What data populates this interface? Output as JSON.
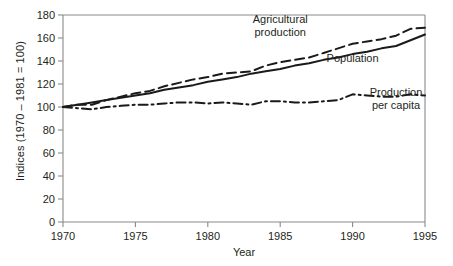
{
  "chart_data": {
    "type": "line",
    "title": "",
    "xlabel": "Year",
    "ylabel": "Indices (1970 – 1981 = 100)",
    "xlim": [
      1970,
      1995
    ],
    "ylim": [
      0,
      180
    ],
    "grid": false,
    "legend_position": "inline-annotations",
    "xticks": [
      "1970",
      "1975",
      "1980",
      "1985",
      "1990",
      "1995"
    ],
    "xtick_values": [
      1970,
      1975,
      1980,
      1985,
      1990,
      1995
    ],
    "yticks": [
      "0",
      "20",
      "40",
      "60",
      "80",
      "100",
      "120",
      "140",
      "160",
      "180"
    ],
    "ytick_values": [
      0,
      20,
      40,
      60,
      80,
      100,
      120,
      140,
      160,
      180
    ],
    "x": [
      1970,
      1971,
      1972,
      1973,
      1974,
      1975,
      1976,
      1977,
      1978,
      1979,
      1980,
      1981,
      1982,
      1983,
      1984,
      1985,
      1986,
      1987,
      1988,
      1989,
      1990,
      1991,
      1992,
      1993,
      1994,
      1995
    ],
    "series": [
      {
        "name": "Agricultural production",
        "style": "dashed",
        "color": "#1a1a1a",
        "values": [
          100,
          102,
          102,
          106,
          109,
          112,
          114,
          118,
          121,
          124,
          126,
          129,
          130,
          131,
          136,
          139,
          141,
          143,
          147,
          151,
          155,
          157,
          159,
          162,
          168,
          169
        ]
      },
      {
        "name": "Population",
        "style": "solid",
        "color": "#1a1a1a",
        "values": [
          100,
          102,
          104,
          106,
          108,
          110,
          112,
          115,
          117,
          119,
          122,
          124,
          126,
          129,
          131,
          133,
          136,
          138,
          141,
          143,
          146,
          148,
          151,
          153,
          158,
          163
        ]
      },
      {
        "name": "Production per capita",
        "style": "dash-dot",
        "color": "#1a1a1a",
        "values": [
          100,
          99,
          98,
          100,
          101,
          102,
          102,
          103,
          104,
          104,
          103,
          104,
          103,
          102,
          105,
          105,
          104,
          104,
          105,
          106,
          111,
          110,
          109,
          109,
          111,
          110
        ]
      }
    ],
    "annotations": [
      {
        "id": "agricultural-production-label",
        "line1": "Agricultural",
        "line2": "production",
        "x": 1985,
        "y": 173
      },
      {
        "id": "population-label",
        "line1": "Population",
        "line2": "",
        "x": 1990,
        "y": 139
      },
      {
        "id": "production-per-capita-label",
        "line1": "Production",
        "line2": "per capita",
        "x": 1993,
        "y": 110
      }
    ],
    "colors": {
      "axis": "#8a8a8a",
      "line": "#1a1a1a",
      "text": "#231f20",
      "background": "#ffffff"
    }
  }
}
